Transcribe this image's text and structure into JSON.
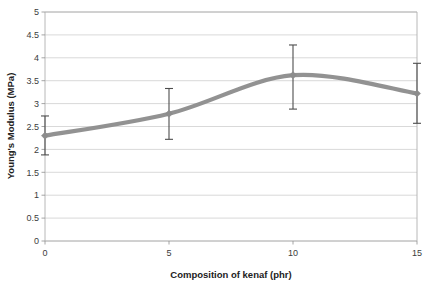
{
  "chart_data": {
    "type": "line",
    "title": "",
    "subtitle": "",
    "xlabel": "Composition of kenaf (phr)",
    "ylabel": "Young's Modulus (MPa)",
    "x": [
      0,
      5,
      10,
      15
    ],
    "values": [
      2.3,
      2.78,
      3.62,
      3.22
    ],
    "series": [
      {
        "name": "Young's Modulus",
        "values": [
          2.3,
          2.78,
          3.62,
          3.22
        ],
        "error_low": [
          1.88,
          2.22,
          2.88,
          2.57
        ],
        "error_high": [
          2.73,
          3.33,
          4.28,
          3.88
        ],
        "error_margin": [
          0.42,
          0.55,
          0.73,
          0.65
        ],
        "color": "#8c8c8c",
        "marker": "diamond",
        "smoothed": true
      }
    ],
    "xlim": [
      0,
      15
    ],
    "ylim": [
      0,
      5
    ],
    "xticks": [
      0,
      5,
      10,
      15
    ],
    "xtick_labels": [
      "0",
      "5",
      "10",
      "15"
    ],
    "yticks": [
      0,
      0.5,
      1,
      1.5,
      2,
      2.5,
      3,
      3.5,
      4,
      4.5,
      5
    ],
    "ytick_labels": [
      "0",
      "0.5",
      "1",
      "1.5",
      "2",
      "2.5",
      "3",
      "3.5",
      "4",
      "4.5",
      "5"
    ],
    "grid": {
      "horizontal": true,
      "vertical": false
    },
    "legend": {
      "visible": false,
      "position": "none"
    },
    "annotations": [],
    "colors": {
      "line": "#8c8c8c",
      "marker": "#8c8c8c",
      "errorbar": "#4d4d4d",
      "gridline": "#c9c9c9",
      "frame": "#b0b0b0",
      "text": "#3c3c3c",
      "background": "#ffffff"
    }
  }
}
